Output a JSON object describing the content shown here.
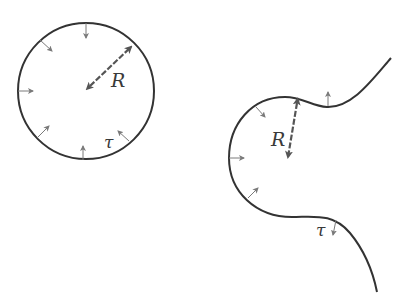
{
  "diagram": {
    "colors": {
      "stroke": "#333333",
      "arrow": "#555555",
      "small_arrow": "#7a7a7a",
      "background": "#ffffff"
    },
    "circle": {
      "radius_label": "R",
      "tension_label": "τ",
      "center": [
        86,
        91
      ],
      "radius": 68
    },
    "curve": {
      "radius_label": "R",
      "tension_label": "τ"
    }
  }
}
